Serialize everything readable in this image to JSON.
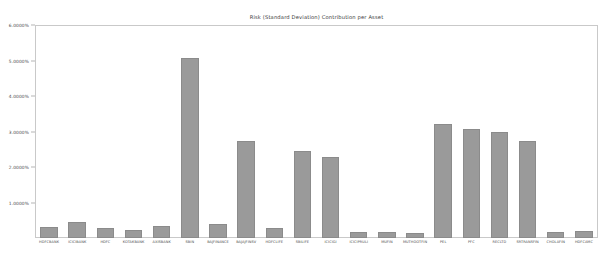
{
  "chart_data": {
    "type": "bar",
    "title": "Risk (Standard Deviation) Contribution per Asset",
    "xlabel": "",
    "ylabel": "",
    "grid": false,
    "legend": null,
    "ylim": [
      0,
      6.0
    ],
    "ytick_labels": [
      "6.0000%",
      "5.0000%",
      "4.0000%",
      "3.0000%",
      "2.0000%",
      "1.0000%"
    ],
    "ytick_values": [
      6.0,
      5.0,
      4.0,
      3.0,
      2.0,
      1.0
    ],
    "bar_color": "#9a9a9a",
    "bar_edge_color": "#8b8b8b",
    "axis_color": "#c9c9c9",
    "categories": [
      "HDFCBANK",
      "ICICIBANK",
      "HDFC",
      "KOTAKBANK",
      "AXISBANK",
      "SBIN",
      "BAJFINANCE",
      "BAJAJFINSV",
      "HDFCLIFE",
      "SBILIFE",
      "ICICIGI",
      "ICICIPRULI",
      "MUFIN",
      "MUTHOOTFIN",
      "PEL",
      "PFC",
      "RECLTD",
      "SRTRANSFIN",
      "CHOLAFIN",
      "HDFCAMC"
    ],
    "values": [
      0.3,
      0.45,
      0.28,
      0.22,
      0.35,
      5.07,
      0.4,
      2.72,
      0.28,
      2.45,
      2.28,
      0.16,
      0.18,
      0.14,
      3.22,
      3.08,
      3.0,
      2.72,
      0.17,
      0.2
    ]
  }
}
